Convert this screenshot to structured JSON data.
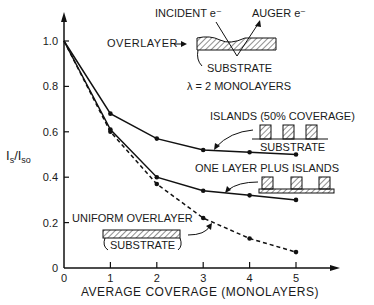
{
  "chart_data": {
    "type": "line",
    "title": "",
    "xlabel": "AVERAGE COVERAGE (MONOLAYERS)",
    "ylabel": "I_s / I_so",
    "x": [
      0,
      1,
      2,
      3,
      4,
      5
    ],
    "xticks": [
      "0",
      "1",
      "2",
      "3",
      "4",
      "5"
    ],
    "yticks": [
      "0",
      "0.2",
      "0.4",
      "0.6",
      "0.8",
      "1.0"
    ],
    "xlim": [
      0,
      5.6
    ],
    "ylim": [
      0,
      1.1
    ],
    "grid": false,
    "series": [
      {
        "name": "ISLANDS (50% COVERAGE)",
        "style": "solid",
        "values": [
          1.0,
          0.68,
          0.57,
          0.52,
          0.51,
          0.5
        ]
      },
      {
        "name": "ONE LAYER PLUS ISLANDS",
        "style": "solid",
        "values": [
          1.0,
          0.61,
          0.4,
          0.34,
          0.32,
          0.3
        ]
      },
      {
        "name": "UNIFORM OVERLAYER",
        "style": "dashed",
        "values": [
          1.0,
          0.6,
          0.37,
          0.22,
          0.13,
          0.07
        ]
      }
    ],
    "annotations": {
      "incident": "INCIDENT e⁻",
      "auger": "AUGER e⁻",
      "overlayer": "OVERLAYER",
      "substrate": "SUBSTRATE",
      "lambda": "λ = 2 MONOLAYERS",
      "islands_label": "ISLANDS (50% COVERAGE)",
      "one_layer_label": "ONE LAYER PLUS ISLANDS",
      "uniform_label": "UNIFORM OVERLAYER"
    }
  }
}
